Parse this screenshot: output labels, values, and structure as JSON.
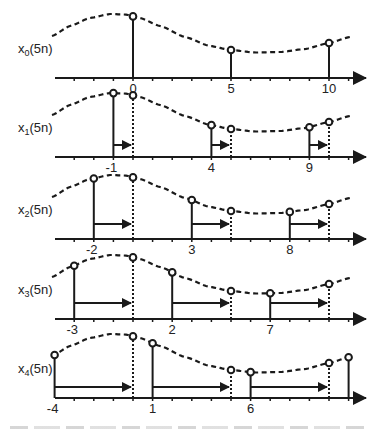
{
  "figure": {
    "type": "polyphase decomposition stem diagram",
    "colors": {
      "ink": "#1a1a1a",
      "background": "#ffffff"
    },
    "axis": {
      "x_start": 55,
      "x_end": 360,
      "zero_px": 133,
      "px_per_n": 19.6,
      "tick_range": [
        -4,
        11
      ]
    },
    "curve_profile": [
      [
        52,
        42
      ],
      [
        70,
        52
      ],
      [
        90,
        60
      ],
      [
        110,
        64
      ],
      [
        125,
        63.5
      ],
      [
        140,
        60
      ],
      [
        160,
        52
      ],
      [
        185,
        41
      ],
      [
        210,
        32
      ],
      [
        231,
        28
      ],
      [
        255,
        25.5
      ],
      [
        280,
        26
      ],
      [
        305,
        29
      ],
      [
        329,
        35
      ],
      [
        350,
        41
      ]
    ],
    "rows": [
      {
        "label_main": "x",
        "label_sub": "0",
        "label_rest": "(5n)",
        "axis_y": 78,
        "arrow_y": null,
        "solid_n": [
          0,
          5,
          10
        ],
        "dotted_n": [],
        "shift": 0,
        "tick_labels": [
          "0",
          "5",
          "10"
        ],
        "tick_label_n": [
          0,
          5,
          10
        ]
      },
      {
        "label_main": "x",
        "label_sub": "1",
        "label_rest": "(5n)",
        "axis_y": 157,
        "arrow_y": 145,
        "solid_n": [
          -1,
          4,
          9
        ],
        "dotted_n": [
          0,
          5,
          10
        ],
        "shift": 1,
        "tick_labels": [
          "-1",
          "4",
          "9"
        ],
        "tick_label_n": [
          -1,
          4,
          9
        ]
      },
      {
        "label_main": "x",
        "label_sub": "2",
        "label_rest": "(5n)",
        "axis_y": 239,
        "arrow_y": 224,
        "solid_n": [
          -2,
          3,
          8
        ],
        "dotted_n": [
          0,
          5,
          10
        ],
        "shift": 2,
        "tick_labels": [
          "-2",
          "3",
          "8"
        ],
        "tick_label_n": [
          -2,
          3,
          8
        ]
      },
      {
        "label_main": "x",
        "label_sub": "3",
        "label_rest": "(5n)",
        "axis_y": 319,
        "arrow_y": 303,
        "solid_n": [
          -3,
          2,
          7
        ],
        "dotted_n": [
          0,
          5,
          10
        ],
        "shift": 3,
        "tick_labels": [
          "-3",
          "2",
          "7"
        ],
        "tick_label_n": [
          -3,
          2,
          7
        ]
      },
      {
        "label_main": "x",
        "label_sub": "4",
        "label_rest": "(5n)",
        "axis_y": 398,
        "arrow_y": 387,
        "solid_n": [
          -4,
          1,
          6,
          11
        ],
        "dotted_n": [
          0,
          5,
          10
        ],
        "shift": 4,
        "tick_labels": [
          "-4",
          "1",
          "6"
        ],
        "tick_label_n": [
          -4,
          1,
          6
        ]
      }
    ]
  }
}
